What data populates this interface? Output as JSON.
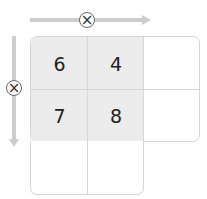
{
  "diagram": {
    "type": "area-model-multiplication-grid",
    "operator_symbol": "×",
    "horizontal_arrow": {
      "direction": "right",
      "operator": "×"
    },
    "vertical_arrow": {
      "direction": "down",
      "operator": "×"
    },
    "cells": [
      {
        "row": 0,
        "col": 0,
        "value": "6",
        "shaded": true
      },
      {
        "row": 0,
        "col": 1,
        "value": "4",
        "shaded": true
      },
      {
        "row": 0,
        "col": 2,
        "value": "",
        "shaded": false
      },
      {
        "row": 1,
        "col": 0,
        "value": "7",
        "shaded": true
      },
      {
        "row": 1,
        "col": 1,
        "value": "8",
        "shaded": true
      },
      {
        "row": 1,
        "col": 2,
        "value": "",
        "shaded": false
      },
      {
        "row": 2,
        "col": 0,
        "value": "",
        "shaded": false
      },
      {
        "row": 2,
        "col": 1,
        "value": "",
        "shaded": false
      }
    ],
    "colors": {
      "arrow": "#cdcdcd",
      "shaded_cell": "#ececec",
      "grid_line": "#d6d6d6"
    }
  }
}
